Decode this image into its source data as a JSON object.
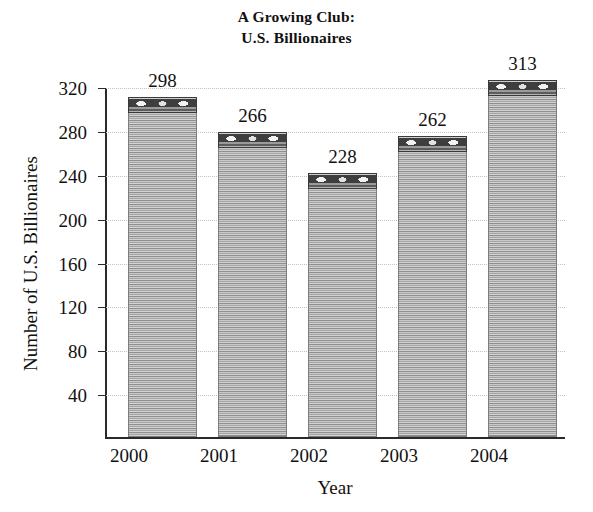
{
  "chart_data": {
    "type": "bar",
    "title": "A Growing Club: U.S. Billionaires",
    "title_lines": [
      "A Growing Club:",
      "U.S. Billionaires"
    ],
    "xlabel": "Year",
    "ylabel": "Number of U.S. Billionaires",
    "categories": [
      "2000",
      "2001",
      "2002",
      "2003",
      "2004"
    ],
    "values": [
      298,
      266,
      228,
      262,
      313
    ],
    "value_labels": [
      "298",
      "266",
      "228",
      "262",
      "313"
    ],
    "ylim": [
      0,
      320
    ],
    "yticks": [
      40,
      80,
      120,
      160,
      200,
      240,
      280,
      320
    ],
    "ytick_labels": [
      "40",
      "80",
      "120",
      "160",
      "200",
      "240",
      "280",
      "320"
    ],
    "grid": true,
    "grid_style": "dotted",
    "legend": null,
    "bar_style": "banknote-stack",
    "colors": {
      "bar_fill": "#a8a8a8",
      "bar_edge": "#7d7d7d",
      "bar_cap": "#3e3e3e",
      "axis": "#2a2a2a",
      "grid": "#c2c2c2",
      "text": "#111111",
      "background": "#ffffff"
    }
  }
}
